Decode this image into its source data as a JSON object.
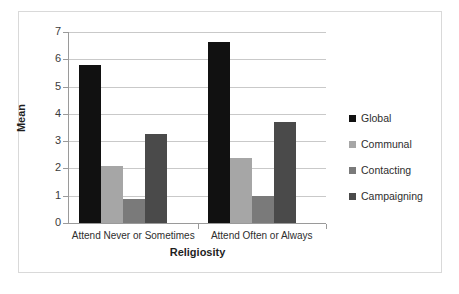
{
  "chart_data": {
    "type": "bar",
    "title": "",
    "xlabel": "Religiosity",
    "ylabel": "Mean",
    "categories": [
      "Attend Never or Sometimes",
      "Attend Often or Always"
    ],
    "series": [
      {
        "name": "Global",
        "values": [
          5.78,
          6.65
        ],
        "color": "#111111"
      },
      {
        "name": "Communal",
        "values": [
          2.1,
          2.38
        ],
        "color": "#a6a6a6"
      },
      {
        "name": "Contacting",
        "values": [
          0.88,
          0.98
        ],
        "color": "#7a7a7a"
      },
      {
        "name": "Campaigning",
        "values": [
          3.26,
          3.7
        ],
        "color": "#4a4a4a"
      }
    ],
    "ylim": [
      0,
      7
    ],
    "yticks": [
      0,
      1,
      2,
      3,
      4,
      5,
      6,
      7
    ],
    "ytick_labels": [
      "0",
      "1",
      "2",
      "3",
      "4",
      "5",
      "6",
      "7"
    ],
    "grid": true,
    "legend_position": "right",
    "legend_marker": "square"
  },
  "frame": {
    "border_color": "#d9d9d9",
    "background": "#ffffff"
  },
  "axis": {
    "line_color": "#9a9a9a",
    "gridline_color": "#c9c9c9"
  }
}
